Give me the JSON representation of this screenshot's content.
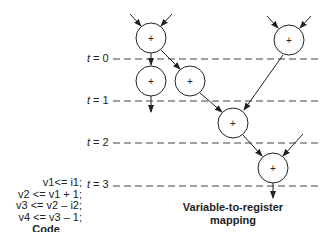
{
  "code": {
    "lines": [
      "v1<= i1;",
      "v2 <= v1 + 1;",
      "v3 <= v2 – i2;",
      "v4 <= v3 – 1;"
    ],
    "title": "Code"
  },
  "mapping": {
    "title_line1": "Variable-to-register",
    "title_line2": "mapping"
  },
  "time_steps": [
    {
      "var": "t",
      "eq": " = 0",
      "y": 59
    },
    {
      "var": "t",
      "eq": " = 1",
      "y": 101
    },
    {
      "var": "t",
      "eq": " = 2",
      "y": 143
    },
    {
      "var": "t",
      "eq": " = 3",
      "y": 185
    }
  ],
  "nodes": [
    {
      "id": "A",
      "label": "+",
      "cx": 151,
      "cy": 38
    },
    {
      "id": "B",
      "label": "+",
      "cx": 151,
      "cy": 81
    },
    {
      "id": "C",
      "label": "+",
      "cx": 190,
      "cy": 81
    },
    {
      "id": "D",
      "label": "+",
      "cx": 289,
      "cy": 40
    },
    {
      "id": "E",
      "label": "+",
      "cx": 233,
      "cy": 123
    },
    {
      "id": "F",
      "label": "+",
      "cx": 273,
      "cy": 168
    }
  ],
  "colors": {
    "stroke": "#222222",
    "dash": "#444444",
    "text": "#222222"
  }
}
